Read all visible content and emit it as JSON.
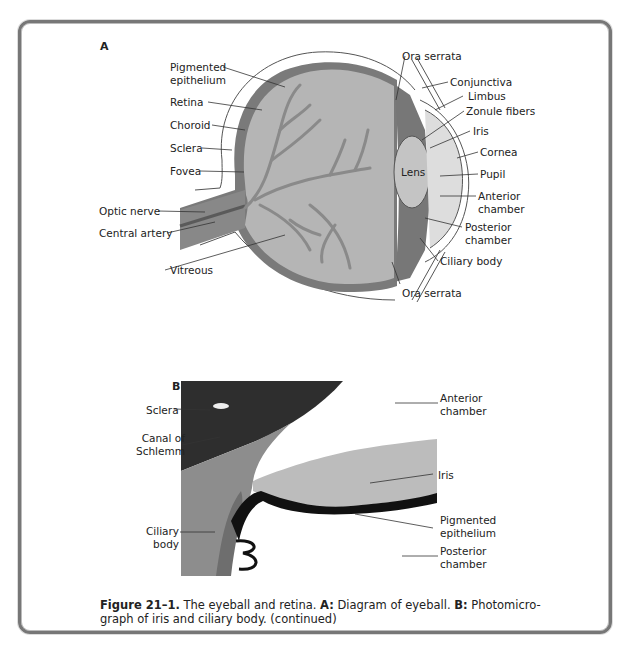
{
  "figure": {
    "panel_a": {
      "letter": "A",
      "title": "Diagram of eyeball",
      "labels_left": [
        {
          "id": "pigmented-epithelium",
          "line1": "Pigmented",
          "line2": "epithelium"
        },
        {
          "id": "retina",
          "line1": "Retina"
        },
        {
          "id": "choroid",
          "line1": "Choroid"
        },
        {
          "id": "sclera",
          "line1": "Sclera"
        },
        {
          "id": "fovea",
          "line1": "Fovea"
        },
        {
          "id": "optic-nerve",
          "line1": "Optic nerve"
        },
        {
          "id": "central-artery",
          "line1": "Central artery"
        },
        {
          "id": "vitreous",
          "line1": "Vitreous"
        }
      ],
      "labels_right": [
        {
          "id": "ora-serrata-top",
          "line1": "Ora serrata"
        },
        {
          "id": "conjunctiva",
          "line1": "Conjunctiva"
        },
        {
          "id": "limbus",
          "line1": "Limbus"
        },
        {
          "id": "zonule-fibers",
          "line1": "Zonule fibers"
        },
        {
          "id": "iris",
          "line1": "Iris"
        },
        {
          "id": "cornea",
          "line1": "Cornea"
        },
        {
          "id": "pupil",
          "line1": "Pupil"
        },
        {
          "id": "anterior-chamber",
          "line1": "Anterior",
          "line2": "chamber"
        },
        {
          "id": "posterior-chamber",
          "line1": "Posterior",
          "line2": "chamber"
        },
        {
          "id": "ciliary-body",
          "line1": "Ciliary body"
        },
        {
          "id": "ora-serrata-bottom",
          "line1": "Ora serrata"
        }
      ],
      "inner_labels": {
        "lens": "Lens"
      }
    },
    "panel_b": {
      "letter": "B",
      "title": "Photomicrograph of iris and ciliary body",
      "labels_left": [
        {
          "id": "sclera",
          "line1": "Sclera"
        },
        {
          "id": "canal-of-schlemm",
          "line1": "Canal of",
          "line2": "Schlemm"
        },
        {
          "id": "ciliary-body",
          "line1": "Ciliary",
          "line2": "body"
        }
      ],
      "labels_right": [
        {
          "id": "anterior-chamber",
          "line1": "Anterior",
          "line2": "chamber"
        },
        {
          "id": "iris",
          "line1": "Iris"
        },
        {
          "id": "pigmented-epithelium",
          "line1": "Pigmented",
          "line2": "epithelium"
        },
        {
          "id": "posterior-chamber",
          "line1": "Posterior",
          "line2": "chamber"
        }
      ]
    },
    "caption": {
      "figure_number": "Figure 21–1.",
      "text1": " The eyeball and retina. ",
      "a_label": "A:",
      "a_text": " Diagram of eyeball. ",
      "b_label": "B:",
      "b_text": " Photomicro-graph of iris and ciliary body. (continued)"
    }
  }
}
